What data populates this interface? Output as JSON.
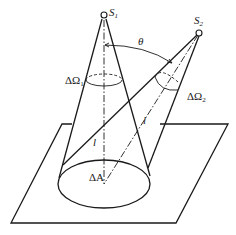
{
  "diagram": {
    "title": "",
    "labels": {
      "source1": "S",
      "source1_sub": "1",
      "source2": "S",
      "source2_sub": "2",
      "angle": "θ",
      "solid_angle1_delta": "ΔΩ",
      "solid_angle1_sub": "1",
      "solid_angle2_delta": "ΔΩ",
      "solid_angle2_sub": "2",
      "distance1": "l",
      "distance2": "l",
      "area": "ΔA"
    },
    "elements": [
      "point source S1 above the area element",
      "point source S2 offset at angle θ",
      "cone from S1 to area ΔA subtending solid angle ΔΩ1",
      "cone from S2 to area ΔA subtending solid angle ΔΩ2",
      "area element ΔA on a plane",
      "distance l from each source to ΔA"
    ],
    "colors": {
      "stroke": "#1a1a1a",
      "background": "#ffffff"
    }
  }
}
